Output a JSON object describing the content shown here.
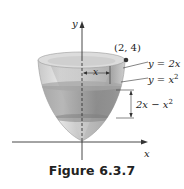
{
  "figure": {
    "caption": "Figure 6.3.7",
    "axes": {
      "x_label": "x",
      "y_label": "y"
    },
    "point": {
      "label": "(2, 4)"
    },
    "curves": [
      {
        "lhs": "y = ",
        "rhs": "2x",
        "sup": ""
      },
      {
        "lhs": "y = ",
        "rhs": "x",
        "sup": "2"
      }
    ],
    "radius_label": "x",
    "height_label": {
      "text": "2x − x",
      "sup": "2"
    },
    "colors": {
      "bowl_light": "#d9d9d9",
      "bowl_mid": "#b5b5b5",
      "bowl_dark": "#8f8f8f",
      "band": "#8a8a8a",
      "axis": "#333333",
      "point": "#333333"
    }
  }
}
